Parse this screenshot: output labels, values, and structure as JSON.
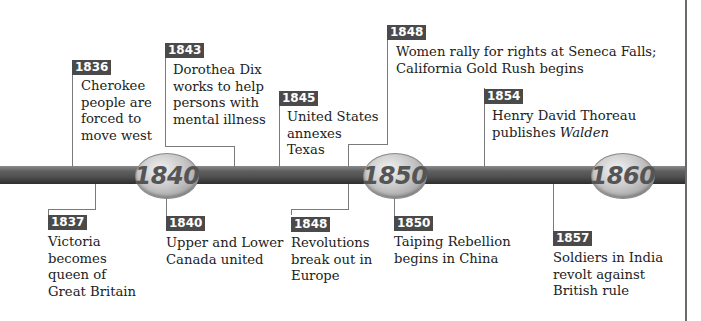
{
  "timeline": {
    "decades": [
      {
        "label": "1840"
      },
      {
        "label": "1850"
      },
      {
        "label": "1860"
      }
    ],
    "events_above": [
      {
        "year": "1836",
        "lines": [
          "Cherokee",
          "people are",
          "forced to",
          "move west"
        ]
      },
      {
        "year": "1843",
        "lines": [
          "Dorothea Dix",
          "works to help",
          "persons with",
          "mental illness"
        ]
      },
      {
        "year": "1845",
        "lines": [
          "United States",
          "annexes",
          "Texas"
        ]
      },
      {
        "year": "1848",
        "lines": [
          "Women rally for rights at Seneca Falls;",
          "California Gold Rush begins"
        ]
      },
      {
        "year": "1854",
        "lines": [
          "Henry David Thoreau"
        ],
        "line2_prefix": "publishes ",
        "line2_italic": "Walden"
      }
    ],
    "events_below": [
      {
        "year": "1837",
        "lines": [
          "Victoria",
          "becomes",
          "queen of",
          "Great Britain"
        ]
      },
      {
        "year": "1840",
        "lines": [
          "Upper and Lower",
          "Canada united"
        ]
      },
      {
        "year": "1848",
        "lines": [
          "Revolutions",
          "break out in",
          "Europe"
        ]
      },
      {
        "year": "1850",
        "lines": [
          "Taiping Rebellion",
          "begins in China"
        ]
      },
      {
        "year": "1857",
        "lines": [
          "Soldiers in India",
          "revolt against",
          "British rule"
        ]
      }
    ]
  },
  "colors": {
    "tag_bg": "#4a4a4a",
    "tag_text": "#ffffff",
    "bar": "#505050",
    "oval_text": "#555555",
    "connector": "#7a7a7a"
  }
}
